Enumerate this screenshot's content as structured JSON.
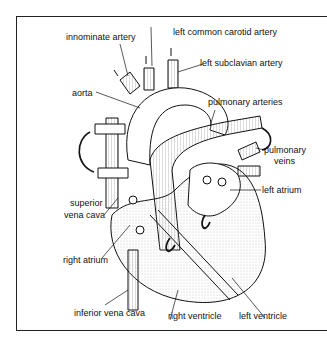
{
  "diagram": {
    "labels": {
      "innominate_artery": "innominate artery",
      "left_common_carotid_artery": "left common carotid artery",
      "left_subclavian_artery": "left subclavian artery",
      "aorta": "aorta",
      "pulmonary_arteries": "pulmonary arteries",
      "pulmonary_veins_1": "pulmonary",
      "pulmonary_veins_2": "veins",
      "left_atrium": "left atrium",
      "superior_vena_cava_1": "superior",
      "superior_vena_cava_2": "vena cava",
      "right_atrium": "right atrium",
      "inferior_vena_cava": "inferior vena cava",
      "right_ventricle": "right ventricle",
      "left_ventricle": "left ventricle"
    },
    "colors": {
      "line": "#111111",
      "fill": "#ffffff",
      "stipple": "#d8d8d8"
    }
  }
}
